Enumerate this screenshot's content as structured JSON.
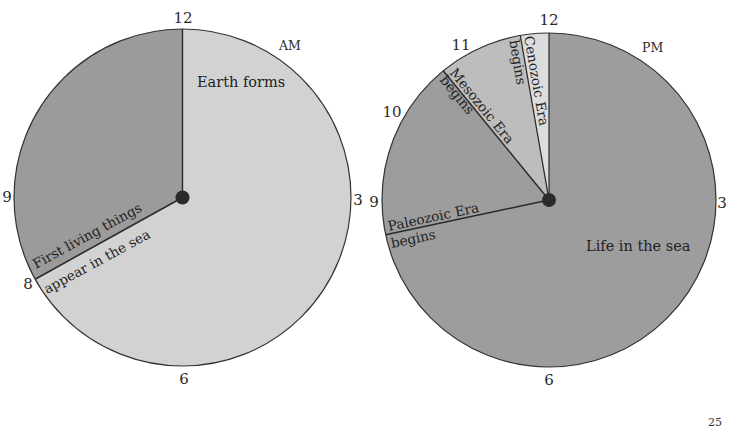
{
  "page_number": "25",
  "colors": {
    "am_light": "#d2d2d2",
    "am_dark": "#9b9b9b",
    "pm_dark": "#9d9d9d",
    "pm_mid": "#bdbdbd",
    "pm_light": "#dcdcdc",
    "outline": "#333333",
    "hub": "#2b2b2b"
  },
  "clocks": {
    "am": {
      "period": "AM",
      "hour_labels": {
        "h12": "12",
        "h3": "3",
        "h6": "6",
        "h9": "9",
        "h8": "8"
      },
      "segments": [
        {
          "label": "Earth forms",
          "start": "12:00",
          "end": "8:00"
        },
        {
          "label": "First living things appear in the sea",
          "start": "8:00",
          "end": "12:00"
        }
      ],
      "labels": {
        "earth_forms": "Earth forms",
        "first_living_line1": "First living things",
        "first_living_line2": "appear in the sea"
      }
    },
    "pm": {
      "period": "PM",
      "hour_labels": {
        "h12": "12",
        "h3": "3",
        "h6": "6",
        "h9": "9",
        "h10": "10",
        "h11": "11"
      },
      "segments": [
        {
          "label": "Life in the sea",
          "start": "12:00",
          "end": "8:36"
        },
        {
          "label": "Paleozoic Era begins",
          "start": "8:36",
          "end": "10:41"
        },
        {
          "label": "Mesozoic Era begins",
          "start": "10:41",
          "end": "11:40"
        },
        {
          "label": "Cenozoic Era begins",
          "start": "11:40",
          "end": "12:00"
        }
      ],
      "labels": {
        "life_in_sea": "Life in the sea",
        "paleozoic_line1": "Paleozoic Era",
        "paleozoic_line2": "begins",
        "mesozoic_line1": "Mesozoic Era",
        "mesozoic_line2": "begins",
        "cenozoic_line1": "Cenozoic Era",
        "cenozoic_line2": "begins"
      }
    }
  }
}
